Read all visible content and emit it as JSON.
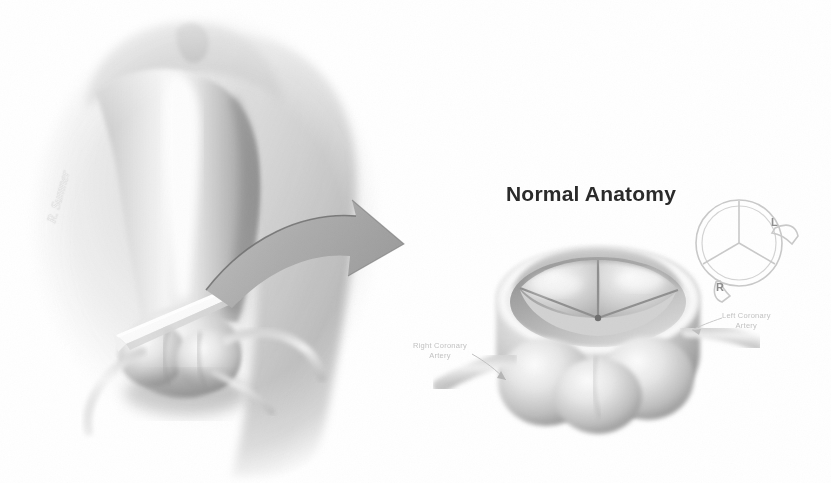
{
  "figure": {
    "kind": "medical-illustration",
    "style": "grayscale airbrush / pencil rendering",
    "background_color": "#ffffff",
    "width": 831,
    "height": 483
  },
  "panels": {
    "left": {
      "name": "aortic-root-in-situ",
      "description": "Aortic arch and root with cutting plane and coronary arteries",
      "signature": "R. Sumner"
    },
    "right": {
      "name": "valve-superior-view",
      "title": "Normal Anatomy",
      "description": "Opened aortic root seen from above showing three sinuses of Valsalva and three cusps"
    }
  },
  "callouts": [
    {
      "name": "right-coronary-artery",
      "line1": "Right Coronary",
      "line2": "Artery",
      "color": "#c2c2c2"
    },
    {
      "name": "left-coronary-artery",
      "line1": "Left Coronary",
      "line2": "Artery",
      "color": "#c2c2c2"
    }
  ],
  "schematic": {
    "name": "valve-orientation-key",
    "description": "Circle with three commissural lines and two coronary ostia branches",
    "labels": {
      "left": "L",
      "right": "R"
    },
    "stroke_color": "#c9c9c9"
  },
  "arrow": {
    "name": "magnification-arrow",
    "direction": "left-to-right curved",
    "fill_color": "#adadad"
  },
  "colors": {
    "title_text": "#2b2b2b",
    "key_letter": "#8d8d8d",
    "callout_text": "#c2c2c2",
    "arrow_fill": "#adadad",
    "tissue_mid": "#b9b9b9",
    "tissue_dark": "#6f6f6f",
    "tissue_light": "#ededed"
  }
}
